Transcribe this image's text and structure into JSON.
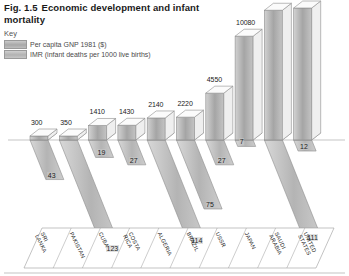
{
  "figure": {
    "number": "Fig. 1.5",
    "title": "Economic development and infant mortality"
  },
  "key": {
    "heading": "Key",
    "items": [
      {
        "label": "Per capita GNP 1981 ($)",
        "swatch": "gnp-swatch",
        "color": "#b0b0b0"
      },
      {
        "label": "IMR (infant deaths per 1000 live births)",
        "swatch": "imr-swatch",
        "color": "#bdbdbd"
      }
    ]
  },
  "chart_data": {
    "type": "bar",
    "title": "Economic development and infant mortality",
    "xlabel": "",
    "ylabel": "",
    "grid": false,
    "legend_position": "top-left",
    "categories": [
      "SRI LANKA",
      "PAKISTAN",
      "CUBA",
      "COSTA RICA",
      "ALGERIA",
      "BRAZIL",
      "USSR",
      "JAPAN",
      "SAUDI ARABIA",
      "UNITED STATES"
    ],
    "series": [
      {
        "name": "Per capita GNP 1981 ($)",
        "unit": "US$",
        "direction": "up",
        "values": [
          300,
          350,
          1410,
          1430,
          2140,
          2220,
          4550,
          10080,
          12600,
          12820
        ]
      },
      {
        "name": "IMR (infant deaths per 1000 live births)",
        "unit": "deaths per 1000 live births",
        "direction": "down",
        "values": [
          43,
          123,
          19,
          27,
          114,
          75,
          27,
          7,
          111,
          12
        ]
      }
    ],
    "gnp_max": 12820,
    "imr_max": 123
  }
}
